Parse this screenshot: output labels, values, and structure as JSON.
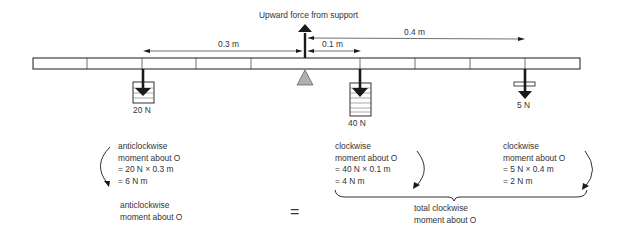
{
  "title_label": "Upward force from support",
  "distances": {
    "left": "0.3 m",
    "right_near": "0.1 m",
    "right_far": "0.4 m"
  },
  "weights": [
    {
      "label": "20 N",
      "position_m": -0.3
    },
    {
      "label": "40 N",
      "position_m": 0.1
    },
    {
      "label": "5 N",
      "position_m": 0.4
    }
  ],
  "anticlockwise_block": {
    "lines": [
      "anticlockwise",
      "moment about O",
      "= 20 N × 0.3 m",
      "= 6 N m"
    ]
  },
  "clockwise_block_1": {
    "lines": [
      "clockwise",
      "moment about O",
      "= 40 N × 0.1 m",
      "= 4 N m"
    ]
  },
  "clockwise_block_2": {
    "lines": [
      "clockwise",
      "moment about O",
      "= 5 N × 0.4 m",
      "= 2 N m"
    ]
  },
  "summary": {
    "left": [
      "anticlockwise",
      "moment about O"
    ],
    "equals": "=",
    "right": [
      "total clockwise",
      "moment about O"
    ]
  },
  "colors": {
    "ink": "#1a1a1a",
    "pivot_fill": "#b0b0b0",
    "beam_fill": "#ffffff"
  }
}
